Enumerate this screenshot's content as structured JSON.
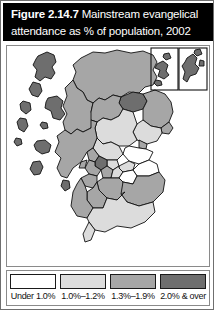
{
  "figure": {
    "title_number": "Figure 2.14.7",
    "title_text": "Mainstream evangelical",
    "title_line2": "attendance as % of population, 2002",
    "title_bar_color": "#000000",
    "title_text_color": "#ffffff",
    "frame_color": "#6f6f6f"
  },
  "legend": {
    "items": [
      {
        "label": "Under 1.0%",
        "color": "#ffffff"
      },
      {
        "label": "1.0%–1.2%",
        "color": "#dcdcdc"
      },
      {
        "label": "1.3%–1.9%",
        "color": "#a6a6a6"
      },
      {
        "label": "2.0% & over",
        "color": "#6e6e6e"
      }
    ]
  },
  "map": {
    "name": "scotland-choropleth",
    "subject": "Scotland council areas",
    "background": "#ffffff",
    "outline_color": "#111111",
    "insets": [
      {
        "name": "orkney-inset",
        "label": ""
      },
      {
        "name": "shetland-inset",
        "label": ""
      }
    ],
    "classes": {
      "under_1": "#ffffff",
      "c1_0_1_2": "#dcdcdc",
      "c1_3_1_9": "#a6a6a6",
      "c2_0_over": "#6e6e6e"
    },
    "regions": [
      {
        "name": "western-isles",
        "class": "c2_0_over"
      },
      {
        "name": "highland-north",
        "class": "c1_3_1_9"
      },
      {
        "name": "highland-west",
        "class": "c1_3_1_9"
      },
      {
        "name": "skye",
        "class": "c2_0_over"
      },
      {
        "name": "moray",
        "class": "c2_0_over"
      },
      {
        "name": "aberdeenshire",
        "class": "c1_3_1_9"
      },
      {
        "name": "aberdeen-city",
        "class": "c1_3_1_9"
      },
      {
        "name": "angus",
        "class": "c1_0_1_2"
      },
      {
        "name": "perth-kinross",
        "class": "c1_0_1_2"
      },
      {
        "name": "dundee",
        "class": "c1_3_1_9"
      },
      {
        "name": "fife",
        "class": "under_1"
      },
      {
        "name": "stirling",
        "class": "c1_0_1_2"
      },
      {
        "name": "argyll-bute",
        "class": "c1_3_1_9"
      },
      {
        "name": "glasgow-city",
        "class": "c2_0_over"
      },
      {
        "name": "north-lanarkshire",
        "class": "c1_3_1_9"
      },
      {
        "name": "south-lanarkshire",
        "class": "c1_3_1_9"
      },
      {
        "name": "renfrewshire",
        "class": "c1_3_1_9"
      },
      {
        "name": "ayrshire",
        "class": "c1_3_1_9"
      },
      {
        "name": "edinburgh-city",
        "class": "c1_0_1_2"
      },
      {
        "name": "lothian",
        "class": "under_1"
      },
      {
        "name": "scottish-borders",
        "class": "c1_3_1_9"
      },
      {
        "name": "dumfries-galloway",
        "class": "c1_0_1_2"
      },
      {
        "name": "orkney",
        "class": "c2_0_over"
      },
      {
        "name": "shetland",
        "class": "c2_0_over"
      }
    ]
  }
}
